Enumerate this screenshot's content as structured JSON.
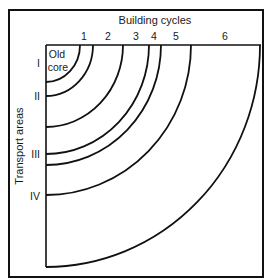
{
  "title": "Building cycles",
  "y_axis_label": "Transport areas",
  "core_label_line1": "Old",
  "core_label_line2": "core",
  "cycles": [
    {
      "label": "1",
      "rx": 47,
      "ry": 51,
      "label_x": 84
    },
    {
      "label": "2",
      "rx": 77,
      "ry": 82,
      "label_x": 108
    },
    {
      "label": "3",
      "rx": 103,
      "ry": 109,
      "label_x": 136
    },
    {
      "label": "4",
      "rx": 115,
      "ry": 120,
      "label_x": 154
    },
    {
      "label": "5",
      "rx": 145,
      "ry": 150,
      "label_x": 176
    },
    {
      "label": "6",
      "rx": 214,
      "ry": 222,
      "label_x": 225
    }
  ],
  "core_arc": {
    "rx": 34,
    "ry": 37
  },
  "transport_areas": [
    {
      "label": "I",
      "y": 63
    },
    {
      "label": "II",
      "y": 96
    },
    {
      "label": "III",
      "y": 154
    },
    {
      "label": "IV",
      "y": 196
    }
  ],
  "colors": {
    "line": "#111111",
    "text": "#1a1a1a",
    "background": "#ffffff"
  }
}
